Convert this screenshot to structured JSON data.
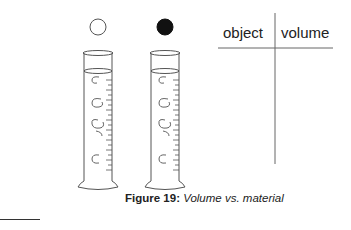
{
  "figure": {
    "objects": [
      {
        "name": "white-ball",
        "fill": "#ffffff"
      },
      {
        "name": "black-ball",
        "fill": "#111111"
      }
    ],
    "table": {
      "headers": [
        "object",
        "volume"
      ],
      "rows": []
    },
    "caption": {
      "label": "Figure 19:",
      "text": "Volume vs. material"
    }
  }
}
